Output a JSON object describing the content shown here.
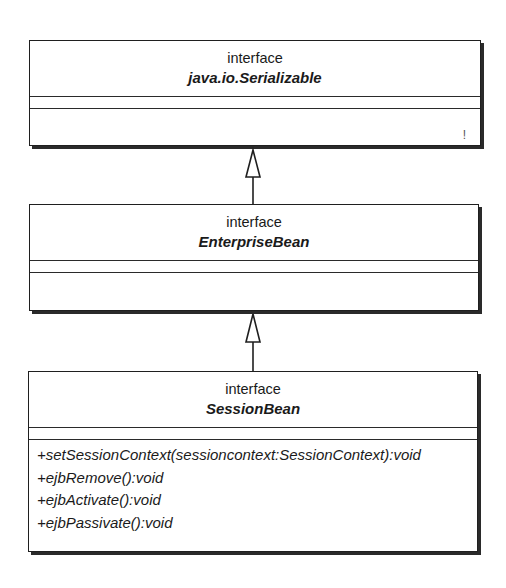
{
  "diagram": {
    "type": "UML class diagram (interface inheritance)",
    "classes": [
      {
        "stereotype": "interface",
        "name": "java.io.Serializable",
        "attributes": [],
        "operations": [],
        "note_mark": "!"
      },
      {
        "stereotype": "interface",
        "name": "EnterpriseBean",
        "attributes": [],
        "operations": []
      },
      {
        "stereotype": "interface",
        "name": "SessionBean",
        "attributes": [],
        "operations": [
          "+setSessionContext(sessioncontext:SessionContext):void",
          "+ejbRemove():void",
          "+ejbActivate():void",
          "+ejbPassivate():void"
        ]
      }
    ],
    "relationships": [
      {
        "type": "generalization",
        "from": "EnterpriseBean",
        "to": "java.io.Serializable"
      },
      {
        "type": "generalization",
        "from": "SessionBean",
        "to": "EnterpriseBean"
      }
    ],
    "colors": {
      "line": "#1f1f1f",
      "shadow": "#2a2a2a",
      "background": "#ffffff"
    }
  }
}
